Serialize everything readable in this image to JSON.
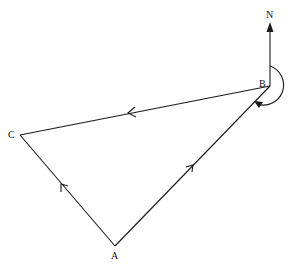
{
  "diagram": {
    "type": "bearing-triangle",
    "colors": {
      "line": "#1a1a1a",
      "background": "#ffffff"
    },
    "points": {
      "A": {
        "label": "A",
        "x": 115,
        "y": 246
      },
      "B": {
        "label": "B",
        "x": 270,
        "y": 86
      },
      "C": {
        "label": "C",
        "x": 20,
        "y": 135
      }
    },
    "north": {
      "label": "N"
    },
    "edges": [
      {
        "from": "A",
        "to": "B",
        "direction_arrow": true
      },
      {
        "from": "B",
        "to": "C",
        "direction_arrow": true
      },
      {
        "from": "C",
        "to": "A",
        "direction_arrow": true,
        "arrow_points_toward": "C"
      }
    ],
    "bearing_arc": {
      "at": "B",
      "from": "North",
      "to": "BA",
      "clockwise": true
    }
  }
}
